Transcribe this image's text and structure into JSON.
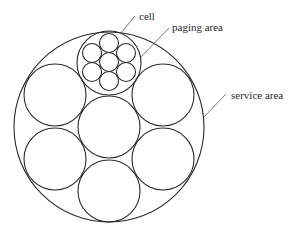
{
  "diagram": {
    "title": "",
    "stroke_color": "#2a2a2a",
    "labels": {
      "cell": "cell",
      "paging_area": "paging area",
      "service_area": "service area"
    },
    "service_area": {
      "cx": 109,
      "cy": 127,
      "r": 95
    },
    "paging_area": {
      "cx": 109,
      "cy": 63,
      "r": 32
    },
    "large_areas": [
      {
        "cx": 109,
        "cy": 127,
        "r": 31
      },
      {
        "cx": 55,
        "cy": 95,
        "r": 31
      },
      {
        "cx": 163,
        "cy": 95,
        "r": 31
      },
      {
        "cx": 55,
        "cy": 159,
        "r": 31
      },
      {
        "cx": 163,
        "cy": 159,
        "r": 31
      },
      {
        "cx": 109,
        "cy": 191,
        "r": 31
      }
    ],
    "cells": [
      {
        "cx": 109,
        "cy": 62,
        "r": 9.5
      },
      {
        "cx": 109,
        "cy": 43,
        "r": 9.5
      },
      {
        "cx": 109,
        "cy": 81,
        "r": 9.5
      },
      {
        "cx": 92,
        "cy": 53,
        "r": 9.5
      },
      {
        "cx": 126,
        "cy": 53,
        "r": 9.5
      },
      {
        "cx": 92,
        "cy": 72,
        "r": 9.5
      },
      {
        "cx": 126,
        "cy": 72,
        "r": 9.5
      }
    ],
    "leaders": {
      "cell": {
        "x1": 135,
        "y1": 16,
        "x2": 121,
        "y2": 33
      },
      "paging_area": {
        "x1": 169,
        "y1": 28,
        "x2": 141,
        "y2": 57
      },
      "service_area": {
        "x1": 226,
        "y1": 94,
        "x2": 203,
        "y2": 118
      }
    }
  }
}
